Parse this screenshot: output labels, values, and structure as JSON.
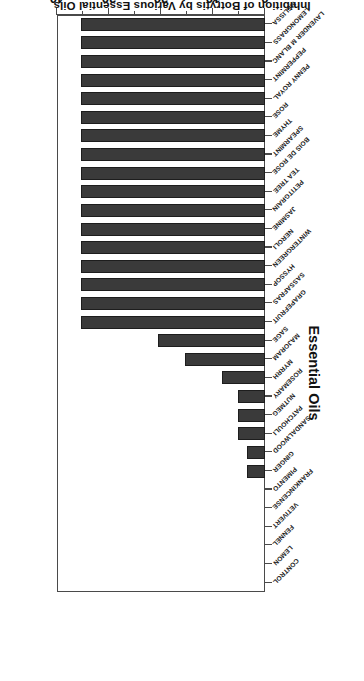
{
  "chart_data": {
    "type": "bar",
    "orientation": "horizontal",
    "title": "Inhibition of Botrytis by Various Essential Oils",
    "xlabel": "Essential Oils",
    "ylabel": "Inhibition (mm)",
    "ylim": [
      0,
      40
    ],
    "grid": false,
    "legend": null,
    "tick_labels": [
      "0",
      "10",
      "20",
      "30",
      "40"
    ],
    "tick_values": [
      0,
      10,
      20,
      30,
      40
    ],
    "minor_tick_values": [
      5,
      15,
      25,
      35
    ],
    "bar_color": "#3a3a3a",
    "categories": [
      "MELISSA",
      "LEMONGRASS",
      "LAVENDER M BLANC",
      "PEPPERMINT",
      "PENNY ROYAL",
      "ROSE",
      "THYME",
      "SPEARMINT",
      "BOIS DE ROSE",
      "TEA TREE",
      "PETITGRAIN",
      "JASMINE",
      "NEROLI",
      "WINTERGREEN",
      "HYSSOP",
      "SASSAFRAS",
      "GRAPEFRUIT",
      "SAGE",
      "MAJORAM",
      "MYRRH",
      "ROSEMARY",
      "NUTMEG",
      "PATCHOULI",
      "SANDALWOOD",
      "GINGER",
      "PIMENTO",
      "FRANKINCENSE",
      "VETIVERT",
      "FENNEL",
      "LEMON",
      "CONTROL"
    ],
    "values": [
      35.4,
      35.4,
      35.4,
      35.4,
      35.4,
      35.4,
      35.4,
      35.4,
      35.4,
      35.4,
      35.4,
      35.4,
      35.4,
      35.4,
      35.4,
      35.4,
      35.4,
      20.6,
      15.3,
      8.2,
      5.2,
      5.2,
      5.2,
      3.4,
      3.4,
      0,
      0,
      0,
      0,
      0,
      0
    ]
  }
}
